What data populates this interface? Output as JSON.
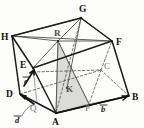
{
  "figure": {
    "kind": "geometry-diagram",
    "background_color": "#fdfdfc",
    "ink_color": "#1c1c1c",
    "shade_color": "#d6d6d2",
    "vertices": [
      {
        "id": "G",
        "label": "G",
        "x": 81,
        "y": 18,
        "label_x": 79,
        "label_y": 12,
        "style": "bold",
        "visible": true
      },
      {
        "id": "H",
        "label": "H",
        "x": 12,
        "y": 36,
        "label_x": 2,
        "label_y": 39,
        "style": "bold",
        "visible": true
      },
      {
        "id": "F",
        "label": "F",
        "x": 112,
        "y": 41,
        "label_x": 116,
        "label_y": 44,
        "style": "bold",
        "visible": true
      },
      {
        "id": "R",
        "label": "R",
        "x": 58,
        "y": 41,
        "label_x": 54,
        "label_y": 35,
        "style": "mid",
        "visible": true
      },
      {
        "id": "E",
        "label": "E",
        "x": 33,
        "y": 68,
        "label_x": 21,
        "label_y": 66,
        "style": "bold",
        "visible": true
      },
      {
        "id": "C",
        "label": "C",
        "x": 101,
        "y": 70,
        "label_x": 104,
        "label_y": 68,
        "style": "light",
        "visible": false
      },
      {
        "id": "K",
        "label": "K",
        "x": 67,
        "y": 88,
        "label_x": 66,
        "label_y": 90,
        "style": "mid",
        "visible": true
      },
      {
        "id": "D",
        "label": "D",
        "x": 20,
        "y": 94,
        "label_x": 8,
        "label_y": 94,
        "style": "bold",
        "visible": true
      },
      {
        "id": "B",
        "label": "B",
        "x": 129,
        "y": 96,
        "label_x": 132,
        "label_y": 99,
        "style": "bold",
        "visible": true
      },
      {
        "id": "Q",
        "label": "Q",
        "x": 37,
        "y": 103,
        "label_x": 31,
        "label_y": 108,
        "style": "light",
        "visible": true
      },
      {
        "id": "P",
        "label": "P",
        "x": 89,
        "y": 104,
        "label_x": 86,
        "label_y": 110,
        "style": "light",
        "visible": true
      },
      {
        "id": "A",
        "label": "A",
        "x": 56,
        "y": 113,
        "label_x": 53,
        "label_y": 124,
        "style": "bold",
        "visible": true
      }
    ],
    "vectors": [
      {
        "id": "e",
        "label": "e",
        "label_x": 25,
        "label_y": 81,
        "from_x": 22,
        "from_y": 85,
        "to_x": 35,
        "to_y": 70
      },
      {
        "id": "d",
        "label": "d",
        "label_x": 14,
        "label_y": 121,
        "from_x": 30,
        "from_y": 110,
        "to_x": 20,
        "to_y": 95
      },
      {
        "id": "b",
        "label": "b",
        "label_x": 100,
        "label_y": 110,
        "from_x": 56,
        "from_y": 113,
        "to_x": 128,
        "to_y": 96
      }
    ],
    "shaded_region": {
      "id": "triangle-ARP",
      "points": "56,113 58,41 89,104",
      "fill": "#d6d6d2"
    }
  }
}
